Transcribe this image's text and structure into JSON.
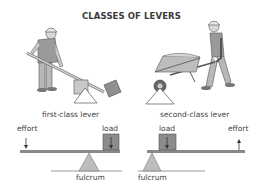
{
  "title": "CLASSES OF LEVERS",
  "first_class": {
    "caption": "first-class lever",
    "effort_label": "effort",
    "load_label": "load",
    "fulcrum_label": "fulcrum"
  },
  "second_class": {
    "caption": "second-class lever",
    "effort_label": "effort",
    "load_label": "load",
    "fulcrum_label": "fulcrum"
  },
  "colors": {
    "beam": "#8a8a8a",
    "fulcrum_fill": "#bdbdbd",
    "load_fill": "#8c8c8c",
    "ground": "#9a9a9a",
    "arrow": "#333333"
  }
}
